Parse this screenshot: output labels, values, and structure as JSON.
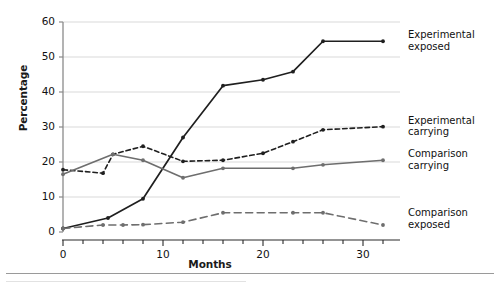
{
  "chart_data": {
    "type": "line",
    "title": "",
    "xlabel": "Months",
    "ylabel": "Percentage",
    "xlim": [
      0,
      33.5
    ],
    "ylim": [
      0,
      62
    ],
    "xticks": [
      0,
      10,
      20,
      30
    ],
    "yticks": [
      0,
      10,
      20,
      30,
      40,
      50,
      60
    ],
    "minor_xtick_interval": 2,
    "grid": "horizontal",
    "legend_position": "inline-right-of-line-end",
    "series": [
      {
        "name": "Experimental exposed",
        "color": "#1f1f1f",
        "linestyle": "solid",
        "marker": "dot",
        "x": [
          0,
          4.5,
          8,
          12,
          16,
          20,
          23,
          26,
          32
        ],
        "y": [
          1,
          4,
          9.5,
          27,
          41.8,
          43.5,
          45.8,
          54.5,
          54.5
        ],
        "label_x": 33.2,
        "label_y": 54.5
      },
      {
        "name": "Experimental carrying",
        "color": "#1f1f1f",
        "linestyle": "dashed",
        "marker": "dot",
        "x": [
          0,
          4,
          5,
          8,
          12,
          16,
          20,
          23,
          26,
          32
        ],
        "y": [
          17.8,
          16.8,
          22.2,
          24.5,
          20.2,
          20.5,
          22.5,
          25.8,
          29.2,
          30.1
        ],
        "label_x": 33.2,
        "label_y": 30.1
      },
      {
        "name": "Comparison carrying",
        "color": "#6e6e6e",
        "linestyle": "solid",
        "marker": "dot",
        "x": [
          0,
          5,
          8,
          12,
          16,
          23,
          26,
          32
        ],
        "y": [
          16.5,
          22.2,
          20.5,
          15.5,
          18.2,
          18.2,
          19.2,
          20.5
        ],
        "label_x": 33.2,
        "label_y": 20.5
      },
      {
        "name": "Comparison exposed",
        "color": "#6e6e6e",
        "linestyle": "long-dashed",
        "marker": "dot",
        "x": [
          0,
          4,
          6,
          8,
          12,
          16,
          23,
          26,
          32
        ],
        "y": [
          1.0,
          2.0,
          2.0,
          2.1,
          2.8,
          5.5,
          5.5,
          5.5,
          2.0
        ],
        "label_x": 33.2,
        "label_y": 3.6
      }
    ]
  },
  "labels": {
    "y_axis_title": "Percentage",
    "x_axis_title": "Months",
    "yticks": [
      "0",
      "10",
      "20",
      "30",
      "40",
      "50",
      "60"
    ],
    "xticks": [
      "0",
      "10",
      "20",
      "30"
    ],
    "series_names": [
      "Experimental exposed",
      "Experimental carrying",
      "Comparison carrying",
      "Comparison exposed"
    ],
    "series_label_lines": [
      [
        "Experimental",
        "exposed"
      ],
      [
        "Experimental",
        "carrying"
      ],
      [
        "Comparison",
        "carrying"
      ],
      [
        "Comparison",
        "exposed"
      ]
    ]
  },
  "colors": {
    "experimental": "#1f1f1f",
    "comparison": "#6e6e6e",
    "grid": "#d9d9d9",
    "axis": "#8a8a8a",
    "background": "#ffffff"
  }
}
